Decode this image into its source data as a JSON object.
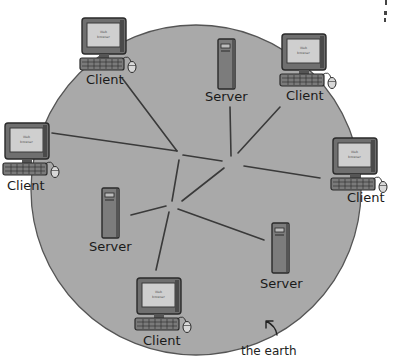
{
  "diagram": {
    "title": "",
    "earth_label": "the earth",
    "colors": {
      "earth_fill": "#a9a9a9",
      "earth_stroke": "#555555",
      "line": "#3a3a3a",
      "monitor_body": "#6f6f6f",
      "screen": "#cfcfcf",
      "server_body": "#7c7c7c"
    },
    "clients": [
      {
        "label": "Client",
        "screen_text_1": "Web",
        "screen_text_2": "browser"
      },
      {
        "label": "Client",
        "screen_text_1": "Web",
        "screen_text_2": "browser"
      },
      {
        "label": "Client",
        "screen_text_1": "Web",
        "screen_text_2": "browser"
      },
      {
        "label": "Client",
        "screen_text_1": "Web",
        "screen_text_2": "browser"
      },
      {
        "label": "Client",
        "screen_text_1": "Web",
        "screen_text_2": "browser"
      }
    ],
    "servers": [
      {
        "label": "Server"
      },
      {
        "label": "Server"
      },
      {
        "label": "Server"
      }
    ],
    "connections": [
      {
        "from": "client-top-left",
        "to": "hub-a"
      },
      {
        "from": "client-left",
        "to": "hub-a"
      },
      {
        "from": "server-top",
        "to": "hub-b"
      },
      {
        "from": "client-top-right",
        "to": "hub-b"
      },
      {
        "from": "client-right",
        "to": "hub-b"
      },
      {
        "from": "hub-a",
        "to": "hub-b"
      },
      {
        "from": "hub-a",
        "to": "hub-c"
      },
      {
        "from": "hub-b",
        "to": "hub-c"
      },
      {
        "from": "server-bottom-left",
        "to": "hub-c"
      },
      {
        "from": "client-bottom",
        "to": "hub-c"
      },
      {
        "from": "server-bottom-right",
        "to": "hub-c"
      }
    ]
  }
}
